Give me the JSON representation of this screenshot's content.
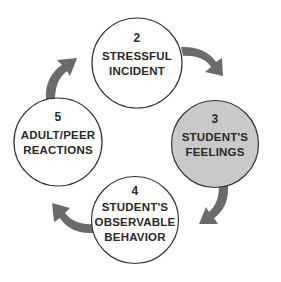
{
  "diagram": {
    "type": "cycle",
    "colors": {
      "circle_fill": "#ffffff",
      "circle_highlight_fill": "#c9c9c9",
      "circle_stroke": "#333333",
      "arrow": "#6b6b6b",
      "text": "#2a2a2a"
    },
    "nodes": [
      {
        "number": "2",
        "line1": "STRESSFUL",
        "line2": "INCIDENT",
        "line3": "",
        "highlighted": false
      },
      {
        "number": "3",
        "line1": "STUDENT'S",
        "line2": "FEELINGS",
        "line3": "",
        "highlighted": true
      },
      {
        "number": "4",
        "line1": "STUDENT'S",
        "line2": "OBSERVABLE",
        "line3": "BEHAVIOR",
        "highlighted": false
      },
      {
        "number": "5",
        "line1": "ADULT/PEER",
        "line2": "REACTIONS",
        "line3": "",
        "highlighted": false
      }
    ],
    "edges": [
      {
        "from": "2",
        "to": "3"
      },
      {
        "from": "3",
        "to": "4"
      },
      {
        "from": "4",
        "to": "5"
      },
      {
        "from": "5",
        "to": "2"
      }
    ]
  }
}
